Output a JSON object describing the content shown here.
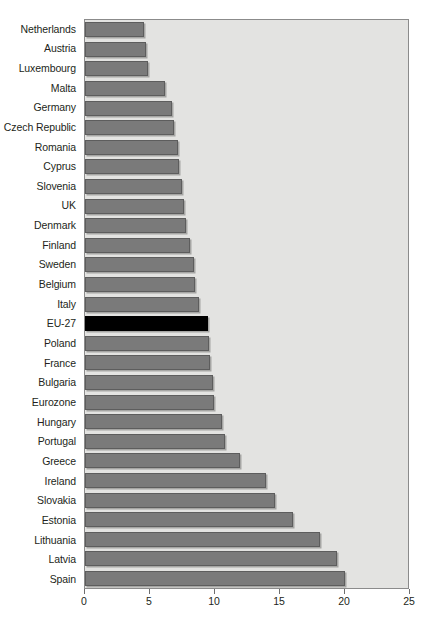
{
  "chart_data": {
    "type": "bar",
    "orientation": "horizontal",
    "title": "",
    "subtitle": "",
    "xlabel": "",
    "ylabel": "",
    "xlim": [
      0,
      25
    ],
    "xticks": [
      0,
      5,
      10,
      15,
      20,
      25
    ],
    "xtick_labels": [
      "0",
      "5",
      "10",
      "15",
      "20",
      "25"
    ],
    "grid": false,
    "legend": null,
    "highlight_category": "EU-27",
    "colors": {
      "bar": "#7a7a7a",
      "bar_border": "#5d5d5d",
      "highlight_bar": "#000000",
      "plot_background": "#e3e3e1",
      "plot_border": "#8b8b8b",
      "text": "#231f20",
      "page_background": "#ffffff"
    },
    "categories": [
      "Netherlands",
      "Austria",
      "Luxembourg",
      "Malta",
      "Germany",
      "Czech Republic",
      "Romania",
      "Cyprus",
      "Slovenia",
      "UK",
      "Denmark",
      "Finland",
      "Sweden",
      "Belgium",
      "Italy",
      "EU-27",
      "Poland",
      "France",
      "Bulgaria",
      "Eurozone",
      "Hungary",
      "Portugal",
      "Greece",
      "Ireland",
      "Slovakia",
      "Estonia",
      "Lithuania",
      "Latvia",
      "Spain"
    ],
    "values": [
      4.6,
      4.7,
      4.9,
      6.2,
      6.7,
      6.9,
      7.2,
      7.3,
      7.5,
      7.7,
      7.8,
      8.1,
      8.4,
      8.5,
      8.8,
      9.5,
      9.6,
      9.7,
      9.9,
      10.0,
      10.6,
      10.8,
      12.0,
      14.0,
      14.7,
      16.1,
      18.2,
      19.5,
      20.1
    ]
  }
}
